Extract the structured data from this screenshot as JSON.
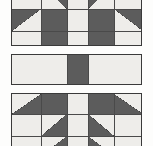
{
  "image": {
    "title": "Quilt block strip",
    "description": "Vertical strip of pieced quilt blocks with half-square triangles",
    "width_px": 153,
    "height_px": 146,
    "background_color": "#fdfdfc"
  },
  "palette": {
    "light_fabric": "#eeedea",
    "dark_fabric": "#5c5c5c",
    "seam_line": "#3a3a3a",
    "grid_line": "#4a4a4a"
  },
  "panels": [
    {
      "name": "top-block",
      "label": "Top quilt block (cropped)",
      "x": 11,
      "y": -16,
      "width": 131,
      "height": 62,
      "columns": 5,
      "rows": 3,
      "col_widths": [
        29,
        26,
        21,
        26,
        29
      ],
      "row_heights": [
        24,
        22,
        16
      ],
      "cells": [
        [
          "light",
          "hst-tr",
          "light",
          "hst-tl",
          "light"
        ],
        [
          "hst-tl",
          "dark",
          "light",
          "dark",
          "hst-tr"
        ],
        [
          "light",
          "dark",
          "light",
          "dark",
          "light"
        ]
      ]
    },
    {
      "name": "middle-sashing",
      "label": "Center sashing strip with cornerstone",
      "x": 11,
      "y": 54,
      "width": 131,
      "height": 31,
      "columns": 3,
      "rows": 1,
      "col_widths": [
        55,
        21,
        55
      ],
      "row_heights": [
        29
      ],
      "cells": [
        [
          "light",
          "dark",
          "light"
        ]
      ]
    },
    {
      "name": "bottom-block",
      "label": "Bottom quilt block (cropped)",
      "x": 11,
      "y": 93,
      "width": 131,
      "height": 62,
      "columns": 5,
      "rows": 3,
      "col_widths": [
        29,
        26,
        21,
        26,
        29
      ],
      "row_heights": [
        20,
        22,
        20
      ],
      "cells": [
        [
          "hst-br",
          "dark",
          "light",
          "dark",
          "hst-bl"
        ],
        [
          "light",
          "hst-br",
          "light",
          "hst-bl",
          "light"
        ],
        [
          "light",
          "hst-br",
          "light",
          "hst-bl",
          "light"
        ]
      ]
    }
  ]
}
